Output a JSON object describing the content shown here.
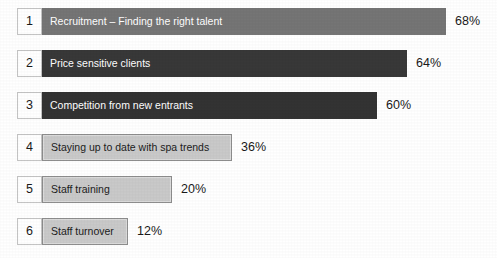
{
  "chart_data": {
    "type": "bar",
    "orientation": "horizontal",
    "title": "",
    "xlabel": "",
    "ylabel": "",
    "xlim": [
      0,
      68
    ],
    "grid": false,
    "legend": null,
    "categories": [
      "Recruitment – Finding the right talent",
      "Price sensitive clients",
      "Competition from new entrants",
      "Staying up to date with spa trends",
      "Staff training",
      "Staff turnover"
    ],
    "values": [
      68,
      64,
      60,
      36,
      20,
      12
    ],
    "value_labels": [
      "68%",
      "64%",
      "60%",
      "36%",
      "20%",
      "12%"
    ],
    "rank_labels": [
      "1",
      "2",
      "3",
      "4",
      "5",
      "6"
    ]
  },
  "rows": [
    {
      "rank": "1",
      "label": "Recruitment – Finding the right talent",
      "value": 68,
      "percent_label": "68%",
      "bar_style": "dark",
      "bar_color": "#757575",
      "text_color": "#ffffff",
      "bar_width_px": 404,
      "top_px": 8
    },
    {
      "rank": "2",
      "label": "Price sensitive clients",
      "value": 64,
      "percent_label": "64%",
      "bar_style": "dark",
      "bar_color": "#383838",
      "text_color": "#ffffff",
      "bar_width_px": 365,
      "top_px": 50
    },
    {
      "rank": "3",
      "label": "Competition from new entrants",
      "value": 60,
      "percent_label": "60%",
      "bar_style": "dark",
      "bar_color": "#333333",
      "text_color": "#ffffff",
      "bar_width_px": 335,
      "top_px": 92
    },
    {
      "rank": "4",
      "label": "Staying up to date with spa trends",
      "value": 36,
      "percent_label": "36%",
      "bar_style": "light",
      "bar_color": "#c9c9c9",
      "text_color": "#1c1c1c",
      "bar_width_px": 190,
      "top_px": 134
    },
    {
      "rank": "5",
      "label": "Staff training",
      "value": 20,
      "percent_label": "20%",
      "bar_style": "light",
      "bar_color": "#c9c9c9",
      "text_color": "#1c1c1c",
      "bar_width_px": 130,
      "top_px": 176
    },
    {
      "rank": "6",
      "label": "Staff turnover",
      "value": 12,
      "percent_label": "12%",
      "bar_style": "light",
      "bar_color": "#c9c9c9",
      "text_color": "#1c1c1c",
      "bar_width_px": 86,
      "top_px": 218
    }
  ],
  "colors": {
    "background": "#ffffff",
    "bar_dark_top": "#757575",
    "bar_dark": "#333333",
    "bar_light": "#c9c9c9",
    "bar_light_border": "#8d8d8d",
    "num_box_border": "#c4c4c4",
    "text_dark": "#1a1a1a",
    "text_light": "#ffffff"
  }
}
